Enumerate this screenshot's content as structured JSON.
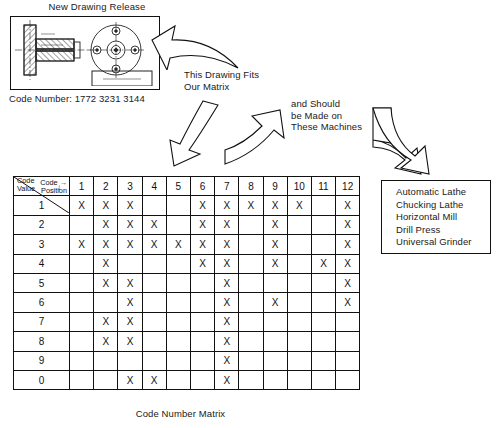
{
  "drawing": {
    "title": "New Drawing Release",
    "code_number_label": "Code Number: 1772 3231 3144",
    "part_icon": "machined-part-drawing-icon"
  },
  "annotations": {
    "fits_matrix_line1": "This Drawing Fits",
    "fits_matrix_line2": "Our Matrix",
    "made_on_line1": "and Should",
    "made_on_line2": "be Made on",
    "made_on_line3": "These Machines"
  },
  "machines": {
    "items": [
      "Automatic Lathe",
      "Chucking Lathe",
      "Horizontal Mill",
      "Drill Press",
      "Universal Grinder"
    ]
  },
  "matrix": {
    "caption": "Code Number Matrix",
    "corner": {
      "position_label_line1": "Code",
      "position_label_line2": "Position",
      "position_arrow": "→",
      "value_label_line1": "Code",
      "value_label_line2": "Value",
      "value_arrow": "↓"
    },
    "columns": [
      "1",
      "2",
      "3",
      "4",
      "5",
      "6",
      "7",
      "8",
      "9",
      "10",
      "11",
      "12"
    ],
    "mark": "X",
    "rows": [
      {
        "value": "1",
        "marks": [
          1,
          1,
          1,
          0,
          0,
          1,
          1,
          1,
          1,
          1,
          0,
          1
        ]
      },
      {
        "value": "2",
        "marks": [
          0,
          1,
          1,
          1,
          0,
          1,
          1,
          0,
          1,
          0,
          0,
          1
        ]
      },
      {
        "value": "3",
        "marks": [
          1,
          1,
          1,
          1,
          1,
          1,
          1,
          0,
          1,
          0,
          0,
          1
        ]
      },
      {
        "value": "4",
        "marks": [
          0,
          1,
          0,
          0,
          0,
          1,
          1,
          0,
          1,
          0,
          1,
          1
        ]
      },
      {
        "value": "5",
        "marks": [
          0,
          1,
          1,
          0,
          0,
          0,
          1,
          0,
          0,
          0,
          0,
          1
        ]
      },
      {
        "value": "6",
        "marks": [
          0,
          0,
          1,
          0,
          0,
          0,
          1,
          0,
          1,
          0,
          0,
          1
        ]
      },
      {
        "value": "7",
        "marks": [
          0,
          1,
          1,
          0,
          0,
          0,
          1,
          0,
          0,
          0,
          0,
          0
        ]
      },
      {
        "value": "8",
        "marks": [
          0,
          1,
          1,
          0,
          0,
          0,
          1,
          0,
          0,
          0,
          0,
          0
        ]
      },
      {
        "value": "9",
        "marks": [
          0,
          0,
          0,
          0,
          0,
          0,
          1,
          0,
          0,
          0,
          0,
          0
        ]
      },
      {
        "value": "0",
        "marks": [
          0,
          0,
          1,
          1,
          0,
          0,
          1,
          0,
          0,
          0,
          0,
          0
        ]
      }
    ]
  },
  "arrows": {
    "drawing_to_matrix_note": "curved-arrow-left-icon",
    "note_to_matrix": "curved-arrow-down-icon",
    "matrix_to_machines_note": "curved-arrow-right-icon",
    "note_to_machine_box": "curved-arrow-down-right-icon"
  },
  "colors": {
    "ink": "#111111",
    "paper": "#ffffff"
  }
}
